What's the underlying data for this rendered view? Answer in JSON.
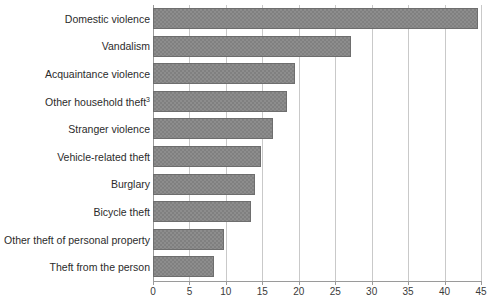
{
  "chart_data": {
    "type": "bar",
    "orientation": "horizontal",
    "title": "",
    "subtitle": "",
    "xlabel": "",
    "ylabel": "",
    "xlim": [
      0,
      45
    ],
    "ylim": null,
    "grid": "vertical",
    "legend": "none",
    "xticks": [
      0,
      5,
      10,
      15,
      20,
      25,
      30,
      35,
      40,
      45
    ],
    "xtick_labels": [
      "0",
      "5",
      "10",
      "15",
      "20",
      "25",
      "30",
      "35",
      "40",
      "45"
    ],
    "categories": [
      "Domestic violence",
      "Vandalism",
      "Acquaintance violence",
      "Other household theft",
      "Stranger violence",
      "Vehicle-related theft",
      "Burglary",
      "Bicycle theft",
      "Other theft of personal property",
      "Theft from the person"
    ],
    "category_footnotes": [
      "",
      "",
      "",
      "3",
      "",
      "",
      "",
      "",
      "",
      ""
    ],
    "values": [
      44.6,
      27.1,
      19.5,
      18.4,
      16.5,
      14.8,
      14.0,
      13.4,
      9.8,
      8.4
    ],
    "series": [
      {
        "name": "",
        "values": [
          44.6,
          27.1,
          19.5,
          18.4,
          16.5,
          14.8,
          14.0,
          13.4,
          9.8,
          8.4
        ]
      }
    ],
    "colors": {
      "bar_fill": "#808080",
      "bar_edge": "#6e6e6e",
      "gridline": "#c9c9c9",
      "axis": "#9a9a9a",
      "text": "#2b2b2b",
      "background": "#ffffff"
    }
  }
}
